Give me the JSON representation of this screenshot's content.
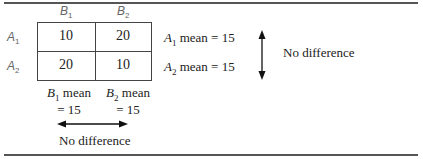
{
  "column_headers": [
    {
      "letter": "B",
      "subscript": "1"
    },
    {
      "letter": "B",
      "subscript": "2"
    }
  ],
  "row_headers": [
    {
      "letter": "A",
      "subscript": "1"
    },
    {
      "letter": "A",
      "subscript": "2"
    }
  ],
  "cells": [
    [
      "10",
      "20"
    ],
    [
      "20",
      "10"
    ]
  ],
  "row_means": [
    {
      "letter": "A",
      "subscript": "1",
      "text": " mean = 15"
    },
    {
      "letter": "A",
      "subscript": "2",
      "text": " mean = 15"
    }
  ],
  "column_means": [
    {
      "letter": "B",
      "subscript": "1",
      "line1": " mean",
      "line2": "= 15"
    },
    {
      "letter": "B",
      "subscript": "2",
      "line1": " mean",
      "line2": "= 15"
    }
  ],
  "row_effect_label": "No difference",
  "column_effect_label": "No difference"
}
